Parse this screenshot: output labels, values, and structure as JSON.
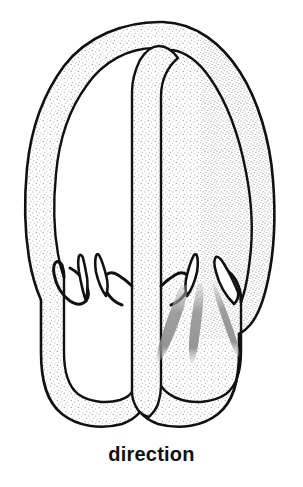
{
  "figure": {
    "caption": "direction",
    "kind": "anatomical-line-drawing",
    "width": 303,
    "height": 487,
    "background_color": "#ffffff",
    "outline_color": "#111111",
    "stipple_color": "#8a8a8a",
    "streak_color": "#9a9a9a",
    "parts": {
      "outer_wall_label": "outer stippled wall",
      "inner_cavity_left_label": "left chamber",
      "inner_cavity_right_label": "right chamber",
      "septum_label": "central septum",
      "hook_left_outer_label": "left outer hook projection",
      "hook_left_inner_label": "left inner hook projection",
      "hook_right_inner_label": "right inner hook projection",
      "hook_right_outer_label": "right outer hook projection",
      "streaks_label": "three tapered shaded streaks"
    }
  }
}
